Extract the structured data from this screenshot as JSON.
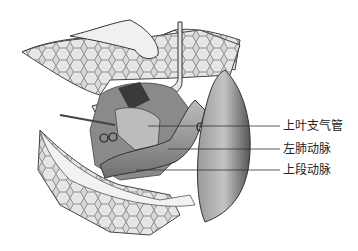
{
  "figure": {
    "labels": [
      {
        "id": "upper-lobe-bronchus",
        "text": "上叶支气管",
        "y": 126,
        "line_start_x": 148
      },
      {
        "id": "left-pulmonary-artery",
        "text": "左肺动脉",
        "y": 149,
        "line_start_x": 168
      },
      {
        "id": "upper-segment-artery",
        "text": "上段动脉",
        "y": 170,
        "line_start_x": 136
      }
    ]
  }
}
